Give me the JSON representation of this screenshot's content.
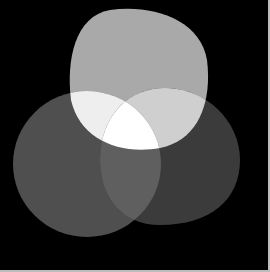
{
  "diagram": {
    "type": "venn-3",
    "background": "#000000",
    "regions": {
      "top": "#a9a9a9",
      "left": "#4f4f4f",
      "right": "#3b3b3b",
      "top_left": "#eeeeee",
      "top_right": "#cfcfcf",
      "left_right": "#5f5f5f",
      "all": "#ffffff"
    }
  }
}
